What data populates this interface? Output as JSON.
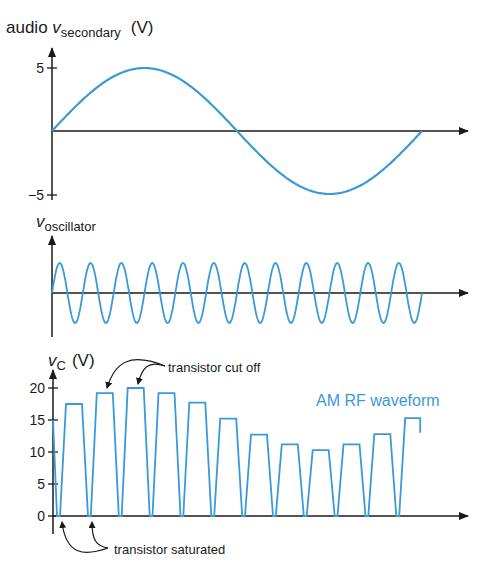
{
  "colors": {
    "wave": "#3a9ad9",
    "axis": "#1a1a1a"
  },
  "panels": {
    "audio": {
      "label_prefix": "audio ",
      "label_var": "v",
      "label_sub": "secondary",
      "label_unit": "(V)",
      "ticks": [
        {
          "value": 5,
          "label": "5"
        },
        {
          "value": -5,
          "label": "−5"
        }
      ]
    },
    "oscillator": {
      "label_var": "v",
      "label_sub": "oscillator"
    },
    "collector": {
      "label_var": "v",
      "label_sub": "C",
      "label_unit": "(V)",
      "ticks": [
        {
          "value": 20,
          "label": "20"
        },
        {
          "value": 15,
          "label": "15"
        },
        {
          "value": 10,
          "label": "10"
        },
        {
          "value": 5,
          "label": "5"
        },
        {
          "value": 0,
          "label": "0"
        }
      ],
      "series_label": "AM RF waveform",
      "annotation_cutoff": "transistor cut off",
      "annotation_saturated": "transistor saturated"
    }
  },
  "chart_data": [
    {
      "type": "line",
      "title": "audio v_secondary (V)",
      "description": "One cycle of audio sine wave, amplitude 5 V",
      "x": [
        0,
        0.25,
        0.5,
        0.75,
        1.0
      ],
      "values": [
        0,
        5,
        0,
        -5,
        0
      ],
      "ylim": [
        -5,
        5
      ]
    },
    {
      "type": "line",
      "title": "v_oscillator",
      "description": "Constant-amplitude carrier, 12 cycles over the same span",
      "cycles": 12
    },
    {
      "type": "line",
      "title": "v_C (V)",
      "description": "AM RF waveform: collector pulses whose peak follows the audio envelope",
      "categories": [
        1,
        2,
        3,
        4,
        5,
        6,
        7,
        8,
        9,
        10,
        11,
        12
      ],
      "values": [
        17.5,
        19.2,
        20,
        19.2,
        17.7,
        15.2,
        12.7,
        11.2,
        10.3,
        11.2,
        12.8,
        15.3
      ],
      "ylim": [
        0,
        20
      ],
      "yticks": [
        0,
        5,
        10,
        15,
        20
      ]
    }
  ]
}
